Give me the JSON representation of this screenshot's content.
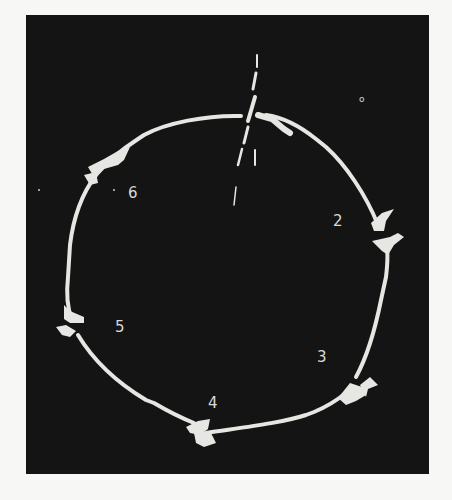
{
  "figure": {
    "background_color": "#141414",
    "trace_color": "#e6e6e2",
    "labels": [
      {
        "id": "0",
        "text": "o",
        "x": 359,
        "y": 95
      },
      {
        "id": "2",
        "text": "2",
        "x": 333,
        "y": 214
      },
      {
        "id": "3",
        "text": "3",
        "x": 317,
        "y": 350
      },
      {
        "id": "4",
        "text": "4",
        "x": 208,
        "y": 396
      },
      {
        "id": "5",
        "text": "5",
        "x": 115,
        "y": 320
      },
      {
        "id": "6",
        "text": "6",
        "x": 128,
        "y": 186
      }
    ]
  }
}
